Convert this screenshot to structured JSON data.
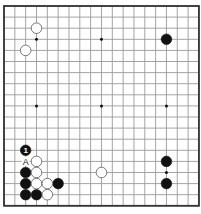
{
  "board": {
    "size": 19,
    "origin_x": 4,
    "origin_y": 6,
    "spacing_x": 10.83,
    "spacing_y": 11.1,
    "stone_radius": 5.3,
    "colors": {
      "black": "#111111",
      "white": "#ffffff",
      "grid": "#9a9a9a",
      "border": "#333333"
    },
    "star_points": [
      [
        3,
        3
      ],
      [
        9,
        3
      ],
      [
        15,
        3
      ],
      [
        3,
        9
      ],
      [
        9,
        9
      ],
      [
        15,
        9
      ],
      [
        3,
        15
      ],
      [
        9,
        15
      ],
      [
        15,
        15
      ]
    ]
  },
  "stones": {
    "black": [
      [
        15,
        3
      ],
      [
        2,
        15
      ],
      [
        2,
        16
      ],
      [
        2,
        17
      ],
      [
        3,
        17
      ],
      [
        5,
        16
      ],
      [
        15,
        14
      ],
      [
        15,
        16
      ]
    ],
    "white": [
      [
        3,
        2
      ],
      [
        2,
        4
      ],
      [
        3,
        14
      ],
      [
        3,
        15
      ],
      [
        3,
        16
      ],
      [
        4,
        16
      ],
      [
        4,
        17
      ],
      [
        9,
        15
      ]
    ]
  },
  "numbered_moves": [
    {
      "color": "black",
      "col": 2,
      "row": 13,
      "label": "1"
    }
  ],
  "point_labels": [
    {
      "col": 2,
      "row": 14,
      "label": "A"
    }
  ]
}
